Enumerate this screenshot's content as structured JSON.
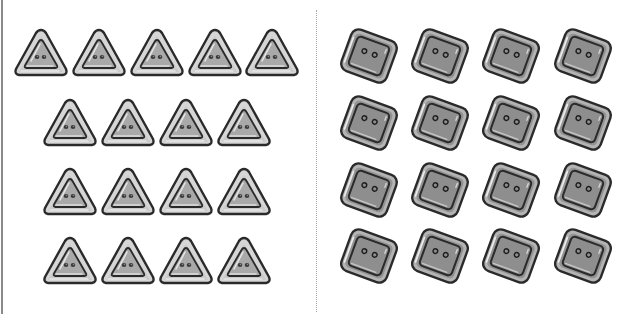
{
  "worksheet": {
    "left_group": {
      "shape": "triangle",
      "button_icon": "triangle-button-icon",
      "count": 17,
      "rows": [
        {
          "count": 5,
          "y": 28,
          "x_centers": [
            41,
            99,
            157,
            215,
            272
          ]
        },
        {
          "count": 4,
          "y": 98,
          "x_centers": [
            70,
            128,
            186,
            244
          ]
        },
        {
          "count": 4,
          "y": 167,
          "x_centers": [
            70,
            128,
            186,
            244
          ]
        },
        {
          "count": 4,
          "y": 236,
          "x_centers": [
            70,
            128,
            186,
            244
          ]
        }
      ]
    },
    "right_group": {
      "shape": "square",
      "button_icon": "square-button-icon",
      "count": 16,
      "rows": [
        {
          "count": 4,
          "y_center": 56,
          "x_centers": [
            369,
            440,
            511,
            583
          ]
        },
        {
          "count": 4,
          "y_center": 123,
          "x_centers": [
            369,
            440,
            511,
            583
          ]
        },
        {
          "count": 4,
          "y_center": 190,
          "x_centers": [
            369,
            440,
            511,
            583
          ]
        },
        {
          "count": 4,
          "y_center": 256,
          "x_centers": [
            369,
            440,
            511,
            583
          ]
        }
      ]
    },
    "colors": {
      "background": "#ffffff",
      "triangle_fill": "#a9a9a9",
      "triangle_rim": "#d6d6d6",
      "square_fill": "#8e8e8e",
      "square_rim": "#b4b4b4",
      "outline": "#2a2a2a",
      "divider": "#a8a8a8",
      "left_edge": "#8a8a8a"
    }
  }
}
